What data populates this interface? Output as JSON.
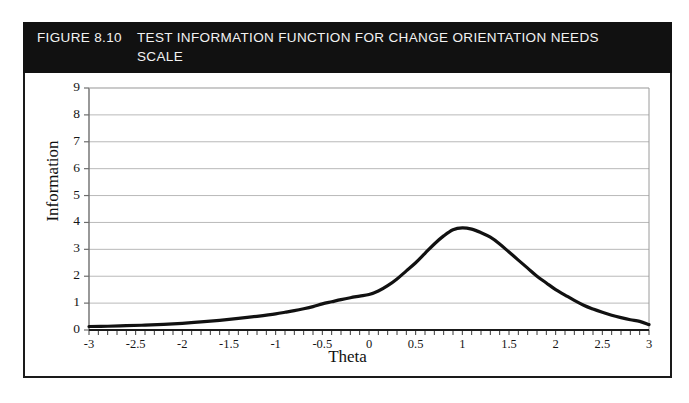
{
  "figure": {
    "number": "FIGURE 8.10",
    "caption": "TEST INFORMATION FUNCTION FOR CHANGE ORIENTATION NEEDS SCALE",
    "header_bg": "#111111",
    "header_text_color": "#f2f2f2",
    "border_color": "#1a1a1a"
  },
  "chart_data": {
    "type": "line",
    "title": "TEST INFORMATION FUNCTION FOR CHANGE ORIENTATION NEEDS SCALE",
    "xlabel": "Theta",
    "ylabel": "Information",
    "xlim": [
      -3,
      3
    ],
    "ylim": [
      0,
      9
    ],
    "xticks": [
      -3,
      -2.5,
      -2,
      -1.5,
      -1,
      -0.5,
      0,
      0.5,
      1,
      1.5,
      2,
      2.5,
      3
    ],
    "xtick_labels": [
      "-3",
      "-2.5",
      "-2",
      "-1.5",
      "-1",
      "-0.5",
      "0",
      "0.5",
      "1",
      "1.5",
      "2",
      "2.5",
      "3"
    ],
    "yticks": [
      0,
      1,
      2,
      3,
      4,
      5,
      6,
      7,
      8,
      9
    ],
    "ytick_labels": [
      "0",
      "1",
      "2",
      "3",
      "4",
      "5",
      "6",
      "7",
      "8",
      "9"
    ],
    "grid": "horizontal",
    "legend": "none",
    "minor_xtick_interval": 0.1,
    "line_color": "#111111",
    "line_width": 3.2,
    "peak": {
      "x": 0.9,
      "y": 3.8
    },
    "x": [
      -3,
      -2.8,
      -2.6,
      -2.4,
      -2.2,
      -2,
      -1.8,
      -1.6,
      -1.4,
      -1.2,
      -1,
      -0.9,
      -0.8,
      -0.7,
      -0.6,
      -0.5,
      -0.4,
      -0.3,
      -0.2,
      -0.1,
      0,
      0.1,
      0.2,
      0.3,
      0.4,
      0.5,
      0.6,
      0.7,
      0.8,
      0.9,
      1,
      1.1,
      1.2,
      1.3,
      1.4,
      1.5,
      1.6,
      1.7,
      1.8,
      1.9,
      2,
      2.1,
      2.2,
      2.3,
      2.4,
      2.5,
      2.6,
      2.7,
      2.8,
      2.9,
      3
    ],
    "y": [
      0.13,
      0.14,
      0.16,
      0.18,
      0.21,
      0.25,
      0.3,
      0.36,
      0.43,
      0.51,
      0.6,
      0.66,
      0.72,
      0.79,
      0.87,
      0.97,
      1.05,
      1.13,
      1.2,
      1.26,
      1.32,
      1.45,
      1.65,
      1.9,
      2.2,
      2.5,
      2.85,
      3.2,
      3.5,
      3.73,
      3.8,
      3.75,
      3.62,
      3.45,
      3.2,
      2.9,
      2.6,
      2.3,
      2,
      1.75,
      1.5,
      1.3,
      1.1,
      0.92,
      0.78,
      0.66,
      0.55,
      0.46,
      0.38,
      0.32,
      0.2
    ]
  }
}
